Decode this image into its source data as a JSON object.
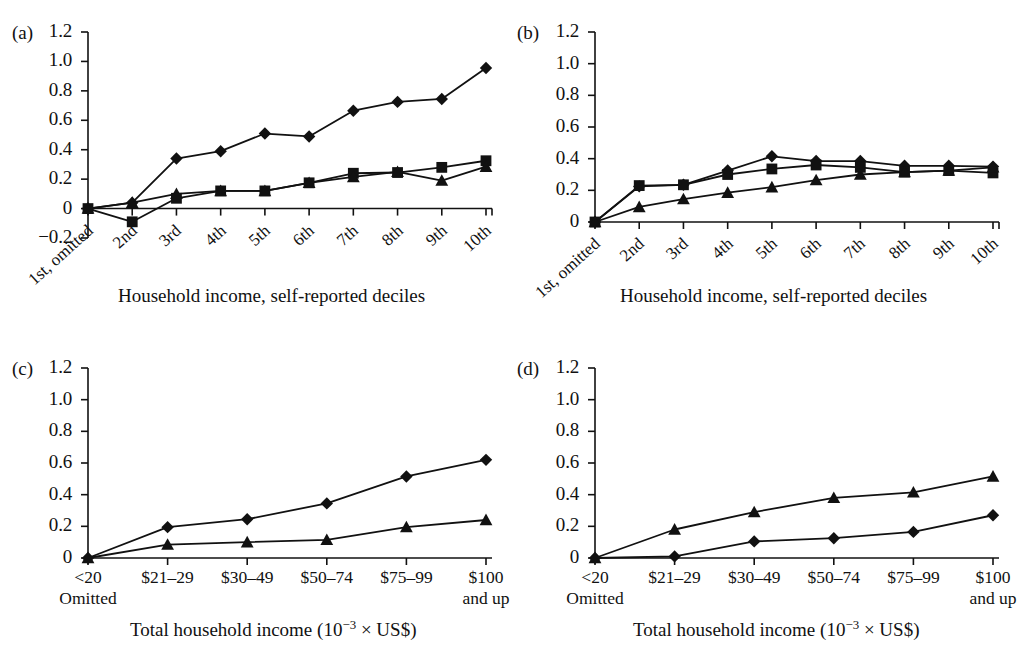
{
  "figure": {
    "panels": [
      {
        "id": "a",
        "label": "(a)",
        "xlabel": "Household income, self-reported deciles",
        "ylabel": "",
        "ylim": [
          -0.2,
          1.2
        ],
        "yticks": [
          "1.2",
          "1.0",
          "0.8",
          "0.6",
          "0.4",
          "0.2",
          "0",
          "−0.2"
        ],
        "ytick_values": [
          1.2,
          1.0,
          0.8,
          0.6,
          0.4,
          0.2,
          0.0,
          -0.2
        ],
        "categories": [
          "1st, omitted",
          "2nd",
          "3rd",
          "4th",
          "5th",
          "6th",
          "7th",
          "8th",
          "9th",
          "10th"
        ],
        "rotated_xticks": true
      },
      {
        "id": "b",
        "label": "(b)",
        "xlabel": "Household income, self-reported deciles",
        "ylabel": "",
        "ylim": [
          0,
          1.2
        ],
        "yticks": [
          "1.2",
          "1.0",
          "0.8",
          "0.6",
          "0.4",
          "0.2",
          "0"
        ],
        "ytick_values": [
          1.2,
          1.0,
          0.8,
          0.6,
          0.4,
          0.2,
          0.0
        ],
        "categories": [
          "1st, omitted",
          "2nd",
          "3rd",
          "4th",
          "5th",
          "6th",
          "7th",
          "8th",
          "9th",
          "10th"
        ],
        "rotated_xticks": true
      },
      {
        "id": "c",
        "label": "(c)",
        "xlabel": "Total household income (10−3 × US$)",
        "xlabel_parts": {
          "pre": "Total household income (10",
          "sup": "−3",
          "post": " × US$)"
        },
        "ylabel": "",
        "ylim": [
          0,
          1.2
        ],
        "yticks": [
          "1.2",
          "1.0",
          "0.8",
          "0.6",
          "0.4",
          "0.2",
          "0"
        ],
        "ytick_values": [
          1.2,
          1.0,
          0.8,
          0.6,
          0.4,
          0.2,
          0.0
        ],
        "categories": [
          "<20",
          "$21–29",
          "$30–49",
          "$50–74",
          "$75–99",
          "$100"
        ],
        "category_sublabels": [
          "Omitted",
          "",
          "",
          "",
          "",
          "and up"
        ],
        "rotated_xticks": false
      },
      {
        "id": "d",
        "label": "(d)",
        "xlabel": "Total household income (10−3 × US$)",
        "xlabel_parts": {
          "pre": "Total household income (10",
          "sup": "−3",
          "post": " × US$)"
        },
        "ylabel": "",
        "ylim": [
          0,
          1.2
        ],
        "yticks": [
          "1.2",
          "1.0",
          "0.8",
          "0.6",
          "0.4",
          "0.2",
          "0"
        ],
        "ytick_values": [
          1.2,
          1.0,
          0.8,
          0.6,
          0.4,
          0.2,
          0.0
        ],
        "categories": [
          "<20",
          "$21–29",
          "$30–49",
          "$50–74",
          "$75–99",
          "$100"
        ],
        "category_sublabels": [
          "Omitted",
          "",
          "",
          "",
          "",
          "and up"
        ],
        "rotated_xticks": false
      }
    ]
  },
  "chart_data": [
    {
      "type": "line",
      "panel": "a",
      "title": "(a)",
      "xlabel": "Household income, self-reported deciles",
      "ylabel": "",
      "ylim": [
        -0.2,
        1.2
      ],
      "grid": false,
      "legend": "none",
      "categories": [
        "1st, omitted",
        "2nd",
        "3rd",
        "4th",
        "5th",
        "6th",
        "7th",
        "8th",
        "9th",
        "10th"
      ],
      "series": [
        {
          "name": "diamond",
          "marker": "diamond",
          "values": [
            0.0,
            0.04,
            0.34,
            0.39,
            0.51,
            0.49,
            0.665,
            0.725,
            0.745,
            0.955
          ]
        },
        {
          "name": "square",
          "marker": "square",
          "values": [
            0.0,
            -0.09,
            0.07,
            0.12,
            0.12,
            0.175,
            0.24,
            0.245,
            0.28,
            0.325
          ]
        },
        {
          "name": "triangle",
          "marker": "triangle",
          "values": [
            0.0,
            0.04,
            0.1,
            0.12,
            0.12,
            0.175,
            0.215,
            0.25,
            0.19,
            0.285
          ]
        }
      ]
    },
    {
      "type": "line",
      "panel": "b",
      "title": "(b)",
      "xlabel": "Household income, self-reported deciles",
      "ylabel": "",
      "ylim": [
        0,
        1.2
      ],
      "grid": false,
      "legend": "none",
      "categories": [
        "1st, omitted",
        "2nd",
        "3rd",
        "4th",
        "5th",
        "6th",
        "7th",
        "8th",
        "9th",
        "10th"
      ],
      "series": [
        {
          "name": "diamond",
          "marker": "diamond",
          "values": [
            0.0,
            0.225,
            0.235,
            0.325,
            0.415,
            0.385,
            0.385,
            0.355,
            0.355,
            0.35
          ]
        },
        {
          "name": "square",
          "marker": "square",
          "values": [
            0.0,
            0.23,
            0.235,
            0.3,
            0.335,
            0.36,
            0.345,
            0.315,
            0.325,
            0.31
          ]
        },
        {
          "name": "triangle",
          "marker": "triangle",
          "values": [
            0.0,
            0.095,
            0.145,
            0.185,
            0.22,
            0.265,
            0.3,
            0.315,
            0.325,
            0.345
          ]
        }
      ]
    },
    {
      "type": "line",
      "panel": "c",
      "title": "(c)",
      "xlabel": "Total household income (10−3 × US$)",
      "ylabel": "",
      "ylim": [
        0,
        1.2
      ],
      "grid": false,
      "legend": "none",
      "categories": [
        "<20",
        "$21–29",
        "$30–49",
        "$50–74",
        "$75–99",
        "$100"
      ],
      "series": [
        {
          "name": "diamond",
          "marker": "diamond",
          "values": [
            0.0,
            0.195,
            0.245,
            0.345,
            0.515,
            0.62
          ]
        },
        {
          "name": "triangle",
          "marker": "triangle",
          "values": [
            0.0,
            0.085,
            0.1,
            0.115,
            0.195,
            0.24
          ]
        }
      ]
    },
    {
      "type": "line",
      "panel": "d",
      "title": "(d)",
      "xlabel": "Total household income (10−3 × US$)",
      "ylabel": "",
      "ylim": [
        0,
        1.2
      ],
      "grid": false,
      "legend": "none",
      "categories": [
        "<20",
        "$21–29",
        "$30–49",
        "$50–74",
        "$75–99",
        "$100"
      ],
      "series": [
        {
          "name": "triangle",
          "marker": "triangle",
          "values": [
            0.0,
            0.18,
            0.29,
            0.38,
            0.415,
            0.515
          ]
        },
        {
          "name": "diamond",
          "marker": "diamond",
          "values": [
            0.0,
            0.01,
            0.105,
            0.125,
            0.165,
            0.27
          ]
        }
      ]
    }
  ]
}
